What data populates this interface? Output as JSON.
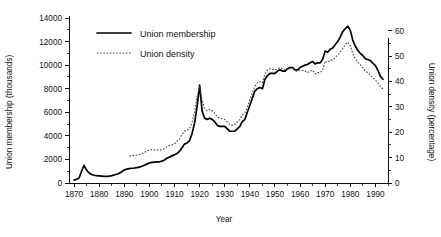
{
  "chart_data": {
    "type": "line",
    "title": "",
    "xlabel": "Year",
    "ylabel": "Union membership (thousands)",
    "y2label": "Union density (percentage)",
    "grid": false,
    "legend_position": "top-center-inside",
    "xlim": [
      1868,
      1995
    ],
    "ylim": [
      0,
      14000
    ],
    "y2lim": [
      0,
      65
    ],
    "xticks": [
      1870,
      1880,
      1890,
      1900,
      1910,
      1920,
      1930,
      1940,
      1950,
      1960,
      1970,
      1980,
      1990
    ],
    "xtick_labels": [
      "1870",
      "1880",
      "1890",
      "1900",
      "1910",
      "1920",
      "1930",
      "1940",
      "1950",
      "1960",
      "1970",
      "1980",
      "1990"
    ],
    "yticks": [
      0,
      2000,
      4000,
      6000,
      8000,
      10000,
      12000,
      14000
    ],
    "ytick_labels": [
      "0",
      "2000",
      "4000",
      "6000",
      "8000",
      "10000",
      "12000",
      "14000"
    ],
    "y2ticks": [
      0,
      10,
      20,
      30,
      40,
      50,
      60
    ],
    "y2tick_labels": [
      "0",
      "10",
      "20",
      "30",
      "40",
      "50",
      "60"
    ],
    "yminor_step": 1000,
    "y2minor_step": 5,
    "xminor_step": 5,
    "series": [
      {
        "name": "Union membership",
        "axis": "left",
        "style": "solid",
        "color": "#000000",
        "x": [
          1870,
          1871,
          1872,
          1873,
          1874,
          1875,
          1876,
          1877,
          1878,
          1879,
          1880,
          1881,
          1882,
          1883,
          1884,
          1885,
          1886,
          1887,
          1888,
          1889,
          1890,
          1891,
          1892,
          1893,
          1894,
          1895,
          1896,
          1897,
          1898,
          1899,
          1900,
          1901,
          1902,
          1903,
          1904,
          1905,
          1906,
          1907,
          1908,
          1909,
          1910,
          1911,
          1912,
          1913,
          1914,
          1915,
          1916,
          1917,
          1918,
          1919,
          1920,
          1921,
          1922,
          1923,
          1924,
          1925,
          1926,
          1927,
          1928,
          1929,
          1930,
          1931,
          1932,
          1933,
          1934,
          1935,
          1936,
          1937,
          1938,
          1939,
          1940,
          1941,
          1942,
          1943,
          1944,
          1945,
          1946,
          1947,
          1948,
          1949,
          1950,
          1951,
          1952,
          1953,
          1954,
          1955,
          1956,
          1957,
          1958,
          1959,
          1960,
          1961,
          1962,
          1963,
          1964,
          1965,
          1966,
          1967,
          1968,
          1969,
          1970,
          1971,
          1972,
          1973,
          1974,
          1975,
          1976,
          1977,
          1978,
          1979,
          1980,
          1981,
          1982,
          1983,
          1984,
          1985,
          1986,
          1987,
          1988,
          1989,
          1990,
          1991,
          1992,
          1993
        ],
        "values": [
          250,
          310,
          420,
          1000,
          1500,
          1100,
          850,
          720,
          660,
          620,
          600,
          580,
          560,
          560,
          580,
          620,
          680,
          740,
          820,
          950,
          1100,
          1180,
          1220,
          1250,
          1270,
          1300,
          1340,
          1420,
          1500,
          1600,
          1700,
          1750,
          1770,
          1790,
          1800,
          1850,
          1950,
          2100,
          2200,
          2300,
          2400,
          2500,
          2700,
          3000,
          3300,
          3400,
          3600,
          4200,
          5100,
          6500,
          8300,
          6100,
          5500,
          5400,
          5500,
          5400,
          5200,
          4900,
          4800,
          4800,
          4800,
          4600,
          4400,
          4390,
          4400,
          4600,
          4800,
          5200,
          5400,
          6000,
          6600,
          7200,
          7800,
          8000,
          8100,
          8000,
          8800,
          9100,
          9300,
          9300,
          9300,
          9500,
          9600,
          9500,
          9500,
          9700,
          9800,
          9800,
          9600,
          9600,
          9800,
          9900,
          10000,
          10070,
          10200,
          10300,
          10100,
          10200,
          10200,
          10500,
          11200,
          11100,
          11350,
          11450,
          11750,
          12000,
          12400,
          12850,
          13100,
          13300,
          12950,
          12100,
          11600,
          11240,
          10990,
          10820,
          10540,
          10480,
          10380,
          10160,
          9950,
          9550,
          9050,
          8800
        ]
      },
      {
        "name": "Union density",
        "axis": "right",
        "style": "dotted",
        "color": "#444444",
        "x": [
          1892,
          1893,
          1894,
          1895,
          1896,
          1897,
          1898,
          1899,
          1900,
          1901,
          1902,
          1903,
          1904,
          1905,
          1906,
          1907,
          1908,
          1909,
          1910,
          1911,
          1912,
          1913,
          1914,
          1915,
          1916,
          1917,
          1918,
          1919,
          1920,
          1921,
          1922,
          1923,
          1924,
          1925,
          1926,
          1927,
          1928,
          1929,
          1930,
          1931,
          1932,
          1933,
          1934,
          1935,
          1936,
          1937,
          1938,
          1939,
          1940,
          1941,
          1942,
          1943,
          1944,
          1945,
          1946,
          1947,
          1948,
          1949,
          1950,
          1951,
          1952,
          1953,
          1954,
          1955,
          1956,
          1957,
          1958,
          1959,
          1960,
          1961,
          1962,
          1963,
          1964,
          1965,
          1966,
          1967,
          1968,
          1969,
          1970,
          1971,
          1972,
          1973,
          1974,
          1975,
          1976,
          1977,
          1978,
          1979,
          1980,
          1981,
          1982,
          1983,
          1984,
          1985,
          1986,
          1987,
          1988,
          1989,
          1990,
          1991,
          1992,
          1993
        ],
        "values": [
          10.6,
          10.8,
          10.9,
          11.0,
          11.2,
          11.6,
          12.0,
          12.6,
          13.0,
          13.2,
          13.1,
          13.0,
          12.9,
          13.1,
          13.6,
          14.4,
          14.8,
          15.0,
          15.4,
          16.4,
          17.5,
          19.0,
          20.5,
          20.8,
          21.5,
          24.0,
          28.0,
          34.0,
          38.0,
          32.5,
          29.5,
          28.5,
          29.0,
          28.5,
          27.5,
          26.0,
          25.5,
          25.3,
          25.0,
          24.0,
          23.0,
          22.7,
          23.0,
          24.0,
          25.0,
          26.8,
          27.5,
          30.0,
          33.0,
          35.5,
          38.0,
          39.5,
          40.0,
          39.5,
          43.0,
          44.5,
          45.0,
          44.8,
          44.5,
          45.0,
          45.5,
          45.0,
          44.5,
          44.8,
          45.0,
          45.0,
          44.2,
          44.0,
          44.5,
          44.3,
          44.0,
          43.5,
          44.0,
          44.5,
          43.0,
          43.5,
          43.5,
          44.5,
          48.0,
          47.5,
          48.5,
          48.5,
          49.5,
          50.5,
          51.5,
          53.0,
          54.5,
          55.5,
          54.0,
          51.0,
          49.0,
          47.5,
          46.5,
          45.5,
          44.0,
          43.5,
          42.5,
          41.5,
          40.5,
          39.5,
          38.0,
          37.0
        ]
      }
    ],
    "legend": [
      {
        "label": "Union membership",
        "style": "solid"
      },
      {
        "label": "Union density",
        "style": "dotted"
      }
    ]
  }
}
